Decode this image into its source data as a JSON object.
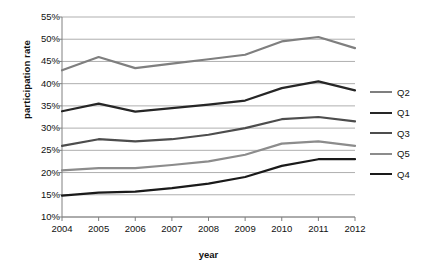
{
  "chart_data": {
    "type": "line",
    "title": "",
    "xlabel": "year",
    "ylabel": "participation rate",
    "categories": [
      "2004",
      "2005",
      "2006",
      "2007",
      "2008",
      "2009",
      "2010",
      "2011",
      "2012"
    ],
    "x": [
      2004,
      2005,
      2006,
      2007,
      2008,
      2009,
      2010,
      2011,
      2012
    ],
    "ylim": [
      10,
      55
    ],
    "ytick_labels": [
      "55%",
      "50%",
      "45%",
      "40%",
      "35%",
      "30%",
      "25%",
      "20%",
      "15%",
      "10%"
    ],
    "ytick_values": [
      55,
      50,
      45,
      40,
      35,
      30,
      25,
      20,
      15,
      10
    ],
    "yaxis_unit": "%",
    "grid": true,
    "legend_position": "right",
    "series": [
      {
        "name": "Q2",
        "color": "#7f7f7f",
        "values": [
          43.0,
          46.0,
          43.5,
          44.5,
          45.5,
          46.5,
          49.5,
          50.5,
          48.0
        ]
      },
      {
        "name": "Q1",
        "color": "#262626",
        "values": [
          33.8,
          35.5,
          33.7,
          34.5,
          35.3,
          36.2,
          39.0,
          40.5,
          38.5
        ]
      },
      {
        "name": "Q3",
        "color": "#4d4d4d",
        "values": [
          26.0,
          27.5,
          27.0,
          27.5,
          28.5,
          30.0,
          32.0,
          32.5,
          31.5
        ]
      },
      {
        "name": "Q5",
        "color": "#8c8c8c",
        "values": [
          20.5,
          21.0,
          21.0,
          21.7,
          22.5,
          24.0,
          26.5,
          27.0,
          26.0
        ]
      },
      {
        "name": "Q4",
        "color": "#1a1a1a",
        "values": [
          14.8,
          15.5,
          15.7,
          16.5,
          17.5,
          19.0,
          21.5,
          23.0,
          23.0
        ]
      }
    ],
    "legend_entries": [
      "Q2",
      "Q1",
      "Q3",
      "Q5",
      "Q4"
    ]
  },
  "axis_colors": {
    "gridline": "#a6a6a6",
    "axis": "#808080",
    "background": "#ffffff"
  }
}
